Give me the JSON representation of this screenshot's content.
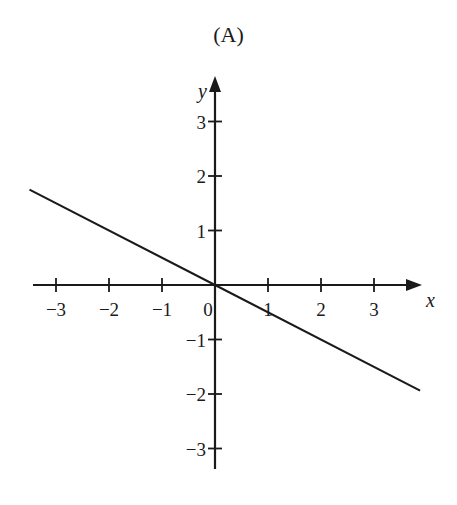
{
  "title": "(A)",
  "chart_data": {
    "type": "line",
    "title": "(A)",
    "xlabel": "x",
    "ylabel": "y",
    "xlim": [
      -3.5,
      3.9
    ],
    "ylim": [
      -3.3,
      3.4
    ],
    "x_ticks": [
      -3,
      -2,
      -1,
      0,
      1,
      2,
      3
    ],
    "y_ticks": [
      -3,
      -2,
      -1,
      1,
      2,
      3
    ],
    "x_tick_labels": [
      "−3",
      "−2",
      "−1",
      "0",
      "1",
      "2",
      "3"
    ],
    "y_tick_labels": [
      "−3",
      "−2",
      "−1",
      "1",
      "2",
      "3"
    ],
    "grid": false,
    "legend": null,
    "series": [
      {
        "name": "line",
        "equation": "y = -x/2",
        "x": [
          -3.5,
          0,
          3.87
        ],
        "y": [
          1.75,
          0,
          -1.94
        ]
      }
    ]
  }
}
